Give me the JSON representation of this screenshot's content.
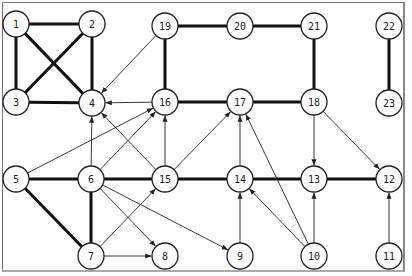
{
  "graph": {
    "node_radius": 13,
    "nodes": [
      {
        "id": "1",
        "x": 16,
        "y": 24
      },
      {
        "id": "2",
        "x": 92,
        "y": 24
      },
      {
        "id": "19",
        "x": 165,
        "y": 26
      },
      {
        "id": "20",
        "x": 240,
        "y": 26
      },
      {
        "id": "21",
        "x": 314,
        "y": 26
      },
      {
        "id": "22",
        "x": 389,
        "y": 26
      },
      {
        "id": "3",
        "x": 16,
        "y": 102
      },
      {
        "id": "4",
        "x": 92,
        "y": 103
      },
      {
        "id": "16",
        "x": 165,
        "y": 102
      },
      {
        "id": "17",
        "x": 240,
        "y": 102
      },
      {
        "id": "18",
        "x": 314,
        "y": 102
      },
      {
        "id": "23",
        "x": 389,
        "y": 103
      },
      {
        "id": "5",
        "x": 16,
        "y": 179
      },
      {
        "id": "6",
        "x": 91,
        "y": 179
      },
      {
        "id": "15",
        "x": 165,
        "y": 179
      },
      {
        "id": "14",
        "x": 240,
        "y": 179
      },
      {
        "id": "13",
        "x": 314,
        "y": 179
      },
      {
        "id": "12",
        "x": 389,
        "y": 179
      },
      {
        "id": "7",
        "x": 91,
        "y": 256
      },
      {
        "id": "8",
        "x": 165,
        "y": 256
      },
      {
        "id": "9",
        "x": 240,
        "y": 256
      },
      {
        "id": "10",
        "x": 314,
        "y": 256
      },
      {
        "id": "11",
        "x": 389,
        "y": 256
      }
    ],
    "undirected_edges": [
      [
        "1",
        "2"
      ],
      [
        "1",
        "3"
      ],
      [
        "1",
        "4"
      ],
      [
        "2",
        "3"
      ],
      [
        "2",
        "4"
      ],
      [
        "3",
        "4"
      ],
      [
        "19",
        "20"
      ],
      [
        "20",
        "21"
      ],
      [
        "19",
        "16"
      ],
      [
        "21",
        "18"
      ],
      [
        "16",
        "17"
      ],
      [
        "17",
        "18"
      ],
      [
        "22",
        "23"
      ],
      [
        "5",
        "6"
      ],
      [
        "6",
        "15"
      ],
      [
        "15",
        "14"
      ],
      [
        "14",
        "13"
      ],
      [
        "13",
        "12"
      ],
      [
        "5",
        "7"
      ],
      [
        "6",
        "7"
      ]
    ],
    "directed_edges": [
      [
        "19",
        "4"
      ],
      [
        "16",
        "4"
      ],
      [
        "6",
        "4"
      ],
      [
        "15",
        "4"
      ],
      [
        "5",
        "16"
      ],
      [
        "6",
        "16"
      ],
      [
        "15",
        "16"
      ],
      [
        "15",
        "17"
      ],
      [
        "14",
        "17"
      ],
      [
        "10",
        "17"
      ],
      [
        "18",
        "13"
      ],
      [
        "18",
        "12"
      ],
      [
        "6",
        "8"
      ],
      [
        "6",
        "9"
      ],
      [
        "7",
        "15"
      ],
      [
        "7",
        "8"
      ],
      [
        "9",
        "14"
      ],
      [
        "10",
        "14"
      ],
      [
        "10",
        "13"
      ],
      [
        "11",
        "12"
      ]
    ]
  }
}
